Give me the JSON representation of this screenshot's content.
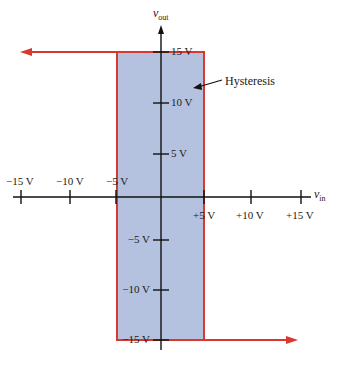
{
  "diagram": {
    "y_axis": {
      "label": "v",
      "label_sub": "out"
    },
    "x_axis": {
      "label": "v",
      "label_sub": "in"
    },
    "x_ticks_negative": [
      "−15 V",
      "−10 V",
      "−5 V"
    ],
    "x_ticks_positive": [
      "+5 V",
      "+10 V",
      "+15 V"
    ],
    "y_ticks_positive": [
      "15 V",
      "10 V",
      "5 V"
    ],
    "y_ticks_negative": [
      "−5 V",
      "−10 V",
      "−15 V"
    ],
    "annotation": "Hysteresis",
    "colors": {
      "curve": "#d9382e",
      "region": "#b4c2e0",
      "axis": "#111111"
    },
    "transfer_curve": {
      "upper_level_V": 15,
      "lower_level_V": -15,
      "upper_threshold_V": 5,
      "lower_threshold_V": -5
    }
  }
}
